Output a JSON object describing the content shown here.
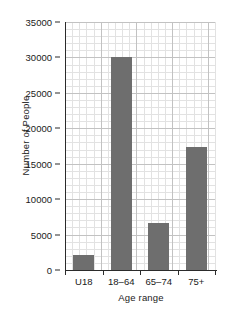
{
  "chart_data": {
    "type": "bar",
    "title": "",
    "xlabel": "Age range",
    "ylabel": "Number of People",
    "categories": [
      "U18",
      "18–64",
      "65–74",
      "75+"
    ],
    "values": [
      2100,
      30100,
      6700,
      17400
    ],
    "ylim": [
      0,
      35000
    ],
    "ytick_labels": [
      "0",
      "5000",
      "10000",
      "15000",
      "20000",
      "25000",
      "30000",
      "35000"
    ],
    "ytick_values": [
      0,
      5000,
      10000,
      15000,
      20000,
      25000,
      30000,
      35000
    ],
    "major_step": 5000,
    "minor_step": 1000,
    "grid": true,
    "legend": "none",
    "bar_color": "#6e6e6e",
    "axis_color": "#2b2b2b",
    "grid_major_color": "#c2c2c2",
    "grid_minor_color": "#e2e2e2",
    "background_color": "#ffffff"
  }
}
